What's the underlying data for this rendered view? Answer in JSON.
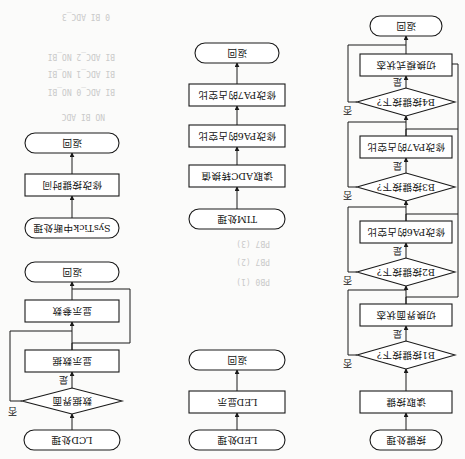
{
  "figure": {
    "orientation": "rotated 180 degrees",
    "background_text": {
      "near_lcd_flow": [
        "0 BI ADC_3",
        "",
        "BI ADC_2 NO_BI",
        "BI ADC_1 NO_BI",
        "BI ADC_0 NO_BI",
        "",
        "NO BI ADC"
      ],
      "near_led_flow": [
        "PB0 (1)",
        "PB7 (2)",
        "PB7 (3)",
        "PB7 (4)"
      ]
    },
    "flows": {
      "key": {
        "start": "按键处理",
        "read": "读取按键",
        "b1": "B1按键按下?",
        "b1_action": "切换界面状态",
        "b2": "B2按键按下?",
        "b2_action": "修改PA6的占空比",
        "b3": "B3按键按下?",
        "b3_action": "修改PA7的占空比",
        "b4": "B4按键按下?",
        "b4_action": "切换模式状态",
        "end": "返回",
        "yes": "是",
        "no": "否"
      },
      "led": {
        "start": "LED处理",
        "action": "LED显示",
        "end": "返回"
      },
      "tim": {
        "start": "TIM处理",
        "read": "读取ADC转换值",
        "pa6": "修改PA6的占空比",
        "pa7": "修改PA7的占空比",
        "end": "返回"
      },
      "lcd": {
        "start": "LCD处理",
        "decision": "数据界面",
        "show_data": "显示数据",
        "show_params": "显示参数",
        "end": "返回",
        "yes": "是",
        "no": "否"
      },
      "systick": {
        "start": "SysTick中断处理",
        "action": "修改按键时间",
        "end": "返回"
      }
    }
  }
}
